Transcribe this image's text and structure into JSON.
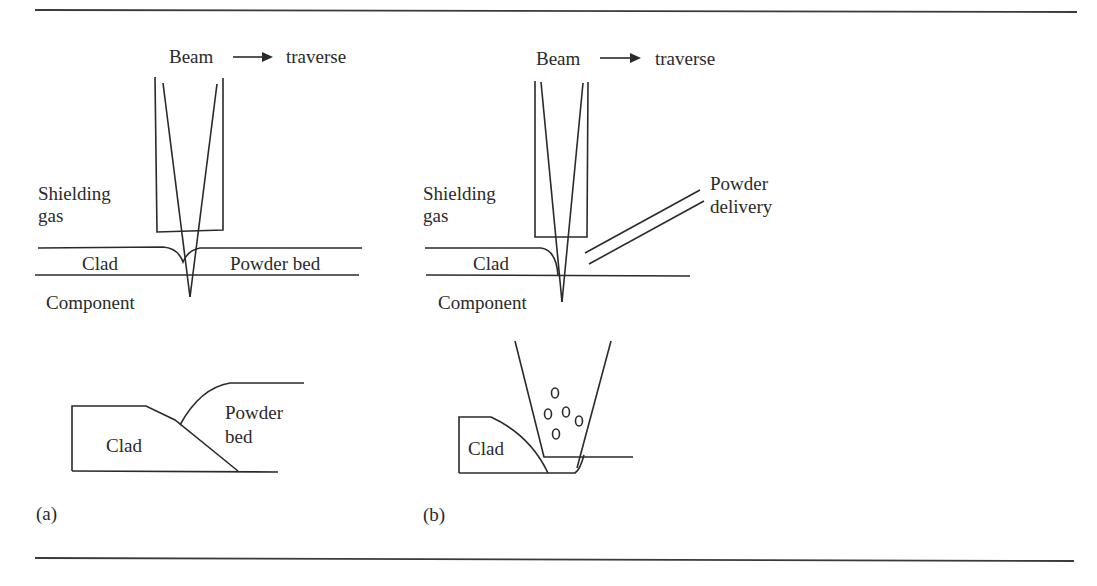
{
  "figure": {
    "panels": [
      {
        "id": "a",
        "panel_label": "(a)",
        "title_beam": "Beam",
        "title_traverse": "traverse",
        "shielding_gas_line1": "Shielding",
        "shielding_gas_line2": "gas",
        "clad": "Clad",
        "powder_bed": "Powder bed",
        "component": "Component",
        "detail_clad": "Clad",
        "detail_powder_line1": "Powder",
        "detail_powder_line2": "bed"
      },
      {
        "id": "b",
        "panel_label": "(b)",
        "title_beam": "Beam",
        "title_traverse": "traverse",
        "shielding_gas_line1": "Shielding",
        "shielding_gas_line2": "gas",
        "powder_delivery_line1": "Powder",
        "powder_delivery_line2": "delivery",
        "clad": "Clad",
        "component": "Component",
        "detail_clad": "Clad"
      }
    ]
  }
}
